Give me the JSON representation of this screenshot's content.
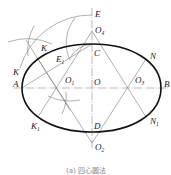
{
  "diagram": {
    "caption": "(a) 四心圆法",
    "points": {
      "E": {
        "label": "E",
        "sub": ""
      },
      "O4": {
        "label": "O",
        "sub": "4"
      },
      "C": {
        "label": "C",
        "sub": ""
      },
      "K_top": {
        "label": "K",
        "sub": ""
      },
      "E1": {
        "label": "E",
        "sub": "1"
      },
      "K_left": {
        "label": "K",
        "sub": ""
      },
      "A": {
        "label": "A",
        "sub": ""
      },
      "O1": {
        "label": "O",
        "sub": "1"
      },
      "O": {
        "label": "O",
        "sub": ""
      },
      "O3": {
        "label": "O",
        "sub": "3"
      },
      "B": {
        "label": "B",
        "sub": ""
      },
      "N": {
        "label": "N",
        "sub": ""
      },
      "K1": {
        "label": "K",
        "sub": "1"
      },
      "D": {
        "label": "D",
        "sub": ""
      },
      "N1": {
        "label": "N",
        "sub": "1"
      },
      "O2": {
        "label": "O",
        "sub": "2"
      }
    },
    "colors": {
      "outline": "#111111",
      "construction": "#7a7a7a"
    }
  }
}
